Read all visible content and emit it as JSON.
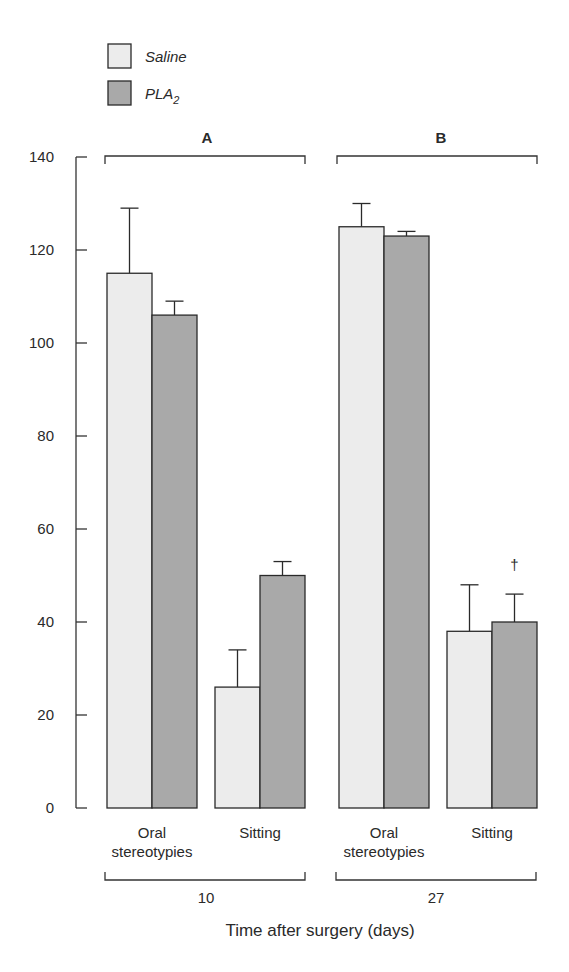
{
  "legend": {
    "items": [
      {
        "label": "Saline",
        "color": "#ececec"
      },
      {
        "label": "PLA",
        "subscript": "2",
        "color": "#a9a9a9"
      }
    ]
  },
  "panels": [
    {
      "label": "A",
      "time": "10"
    },
    {
      "label": "B",
      "time": "27"
    }
  ],
  "xlabel": "Time after surgery (days)",
  "chart_data": {
    "type": "bar",
    "title": "",
    "xlabel": "Time after surgery (days)",
    "ylabel": "",
    "ylim": [
      0,
      140
    ],
    "yticks": [
      0,
      20,
      40,
      60,
      80,
      100,
      120,
      140
    ],
    "grid": false,
    "legend_position": "top-left",
    "groups": [
      {
        "panel": "A",
        "time_days": "10",
        "category": "Oral stereotypies",
        "category_lines": [
          "Oral",
          "stereotypies"
        ],
        "values": {
          "Saline": 115,
          "PLA2": 106
        },
        "error": {
          "Saline": 14,
          "PLA2": 3
        }
      },
      {
        "panel": "A",
        "time_days": "10",
        "category": "Sitting",
        "category_lines": [
          "Sitting"
        ],
        "values": {
          "Saline": 26,
          "PLA2": 50
        },
        "error": {
          "Saline": 8,
          "PLA2": 3
        }
      },
      {
        "panel": "B",
        "time_days": "27",
        "category": "Oral stereotypies",
        "category_lines": [
          "Oral",
          "stereotypies"
        ],
        "values": {
          "Saline": 125,
          "PLA2": 123
        },
        "error": {
          "Saline": 5,
          "PLA2": 1
        }
      },
      {
        "panel": "B",
        "time_days": "27",
        "category": "Sitting",
        "category_lines": [
          "Sitting"
        ],
        "values": {
          "Saline": 38,
          "PLA2": 40
        },
        "error": {
          "Saline": 10,
          "PLA2": 6
        },
        "annotation": {
          "PLA2": "†"
        }
      }
    ],
    "series": [
      {
        "name": "Saline",
        "values": [
          115,
          26,
          125,
          38
        ],
        "errors": [
          14,
          8,
          5,
          10
        ]
      },
      {
        "name": "PLA2",
        "values": [
          106,
          50,
          123,
          40
        ],
        "errors": [
          3,
          3,
          1,
          6
        ]
      }
    ],
    "categories": [
      "Oral stereotypies (10 d)",
      "Sitting (10 d)",
      "Oral stereotypies (27 d)",
      "Sitting (27 d)"
    ],
    "annotations": [
      {
        "text": "†",
        "target": "PLA2, Sitting, 27 days"
      }
    ]
  }
}
